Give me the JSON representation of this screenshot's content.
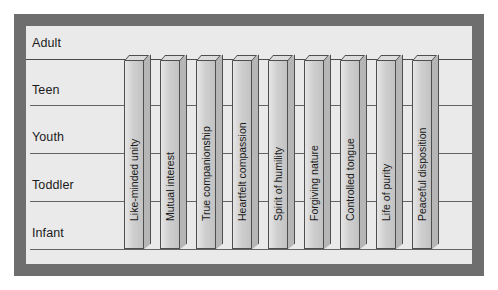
{
  "chart_data": {
    "type": "bar",
    "title": "",
    "subtitle": "",
    "xlabel": "",
    "ylabel": "",
    "orientation": "vertical",
    "style": "3d-column",
    "grid": true,
    "legend_position": "none",
    "y_axis": {
      "type": "categorical-ordinal",
      "tick_labels": [
        "Adult",
        "Teen",
        "Youth",
        "Toddler",
        "Infant"
      ],
      "order": "top-to-bottom",
      "baseline": "Infant",
      "ylim": [
        "Infant",
        "Adult"
      ]
    },
    "categories": [
      "Like-minded unity",
      "Mutual interest",
      "True companionship",
      "Heartfelt compassion",
      "Spirit of humility",
      "Forgiving nature",
      "Controlled tongue",
      "Life of purity",
      "Peaceful disposition"
    ],
    "values": [
      "Adult",
      "Adult",
      "Adult",
      "Adult",
      "Adult",
      "Adult",
      "Adult",
      "Adult",
      "Adult"
    ],
    "value_levels": [
      5,
      5,
      5,
      5,
      5,
      5,
      5,
      5,
      5
    ],
    "annotations": []
  },
  "figure": {
    "frame_color": "#6e6e6e",
    "plot_background": "#eaeaea",
    "bar_face_color": "#cfcfcf",
    "bar_top_color": "#dcdcdc",
    "bar_side_color": "#b6b6b6",
    "bar_edge_color": "#4f4f4f",
    "gridline_color": "#4a4a4a",
    "text_color": "#1a1a1a"
  },
  "ytick_layout": [
    {
      "label": "Adult",
      "label_y": 10,
      "grid_y": 33
    },
    {
      "label": "Teen",
      "label_y": 57,
      "grid_y": 79
    },
    {
      "label": "Youth",
      "label_y": 104,
      "grid_y": 127
    },
    {
      "label": "Toddler",
      "label_y": 152,
      "grid_y": 175
    },
    {
      "label": "Infant",
      "label_y": 200,
      "grid_y": 223
    }
  ],
  "bar_layout": [
    {
      "x": 98,
      "top": 34,
      "height": 189
    },
    {
      "x": 134,
      "top": 34,
      "height": 189
    },
    {
      "x": 170,
      "top": 34,
      "height": 189
    },
    {
      "x": 206,
      "top": 34,
      "height": 189
    },
    {
      "x": 242,
      "top": 34,
      "height": 189
    },
    {
      "x": 278,
      "top": 34,
      "height": 189
    },
    {
      "x": 314,
      "top": 34,
      "height": 189
    },
    {
      "x": 350,
      "top": 34,
      "height": 189
    },
    {
      "x": 386,
      "top": 34,
      "height": 189
    }
  ]
}
